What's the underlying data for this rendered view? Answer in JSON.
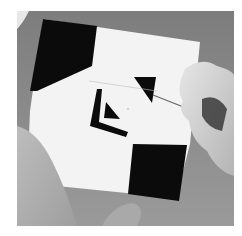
{
  "image": {
    "subject": "hands painting a black and white geometric tile",
    "description": "Grayscale photograph of a square white tile with black geometric shapes (corner blocks, chevron, triangles) being painted with a fine brush held by a hand on the right; a second hand steadies the tile from bottom-left.",
    "palette": {
      "background": "#ffffff",
      "table": "#8c8c8c",
      "tile": "#f4f4f4",
      "paint": "#0c0c0c",
      "skin": "#d2d2d2"
    }
  }
}
